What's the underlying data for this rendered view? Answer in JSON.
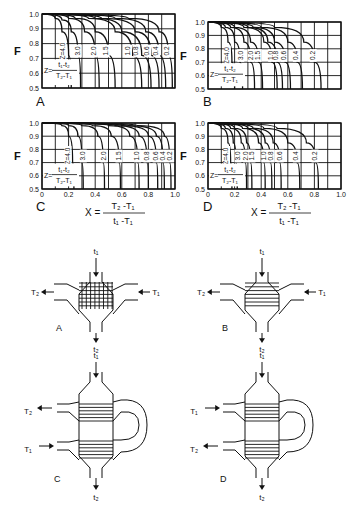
{
  "figure": {
    "y_axis_label": "F",
    "y_ticks": [
      "1.0",
      "0.9",
      "0.8",
      "0.7",
      "0.6",
      "0.5"
    ],
    "x_ticks": [
      "0",
      "0.2",
      "0.4",
      "0.6",
      "0.8",
      "1.0"
    ],
    "z_def": {
      "prefix": "Z=",
      "num": "t₁-t₂",
      "den": "T₂-T₁"
    },
    "x_def": {
      "prefix": "X =",
      "num": "T₂ -T₁",
      "den": "t₁ -T₁"
    },
    "panels": [
      {
        "id": "A",
        "label": "A",
        "z_labels": [
          "Z=4.0",
          "3.0",
          "2.0",
          "1.5",
          "1.0",
          "0.8",
          "0.6",
          "0.4",
          "0.2"
        ]
      },
      {
        "id": "B",
        "label": "B",
        "z_labels": [
          "Z=4.0",
          "3.0",
          "2.0",
          "1.5",
          "1.0",
          "0.8",
          "0.6",
          "0.4",
          "0.2"
        ]
      },
      {
        "id": "C",
        "label": "C",
        "z_labels": [
          "Z=4.0",
          "3.0",
          "2.0",
          "1.5",
          "1.0",
          "0.8",
          "0.6",
          "0.4",
          "0.2"
        ]
      },
      {
        "id": "D",
        "label": "D",
        "z_labels": [
          "Z=4.0",
          "3.0",
          "2.0",
          "1.5",
          "1.0",
          "0.8",
          "0.6",
          "0.4",
          "0.2"
        ]
      }
    ],
    "exchangers": [
      {
        "id": "A",
        "label": "A",
        "top": "t₁",
        "bottom": "t₂",
        "left": "T₂",
        "right": "T₁",
        "type": "crossflow-mixed-grid"
      },
      {
        "id": "B",
        "label": "B",
        "top": "t₁",
        "bottom": "t₂",
        "left": "T₂",
        "right": "T₁",
        "type": "crossflow-single-pass"
      },
      {
        "id": "C",
        "label": "C",
        "top": "t₁",
        "bottom": "t₂",
        "upper_left": "T₂",
        "lower_left": "T₁",
        "type": "two-pass-counter"
      },
      {
        "id": "D",
        "label": "D",
        "top": "t₁",
        "bottom": "t₂",
        "upper_left": "T₁",
        "lower_left": "T₂",
        "type": "two-pass-parallel"
      }
    ]
  },
  "chart_data": [
    {
      "type": "line",
      "title": "A",
      "xlabel": "X = (T2-T1)/(t1-T1)",
      "ylabel": "F",
      "xlim": [
        0,
        1
      ],
      "ylim": [
        0.5,
        1.0
      ],
      "grid": true,
      "series": [
        {
          "name": "Z=4.0",
          "x": [
            0,
            0.1,
            0.15,
            0.2,
            0.22
          ],
          "y": [
            1.0,
            0.97,
            0.88,
            0.72,
            0.5
          ]
        },
        {
          "name": "Z=3.0",
          "x": [
            0,
            0.15,
            0.22,
            0.27,
            0.29
          ],
          "y": [
            1.0,
            0.96,
            0.88,
            0.72,
            0.5
          ]
        },
        {
          "name": "Z=2.0",
          "x": [
            0,
            0.2,
            0.32,
            0.4,
            0.43
          ],
          "y": [
            1.0,
            0.97,
            0.88,
            0.72,
            0.5
          ]
        },
        {
          "name": "Z=1.5",
          "x": [
            0,
            0.25,
            0.4,
            0.5,
            0.55
          ],
          "y": [
            1.0,
            0.97,
            0.88,
            0.72,
            0.5
          ]
        },
        {
          "name": "Z=1.0",
          "x": [
            0,
            0.35,
            0.55,
            0.68,
            0.75
          ],
          "y": [
            1.0,
            0.97,
            0.88,
            0.72,
            0.5
          ]
        },
        {
          "name": "Z=0.8",
          "x": [
            0,
            0.4,
            0.6,
            0.75,
            0.82
          ],
          "y": [
            1.0,
            0.97,
            0.88,
            0.72,
            0.5
          ]
        },
        {
          "name": "Z=0.6",
          "x": [
            0,
            0.45,
            0.7,
            0.82,
            0.88
          ],
          "y": [
            1.0,
            0.97,
            0.88,
            0.72,
            0.5
          ]
        },
        {
          "name": "Z=0.4",
          "x": [
            0,
            0.55,
            0.78,
            0.88,
            0.93
          ],
          "y": [
            1.0,
            0.97,
            0.88,
            0.72,
            0.5
          ]
        },
        {
          "name": "Z=0.2",
          "x": [
            0,
            0.65,
            0.88,
            0.95,
            0.98
          ],
          "y": [
            1.0,
            0.97,
            0.88,
            0.72,
            0.5
          ]
        }
      ]
    },
    {
      "type": "line",
      "title": "B",
      "xlabel": "X = (T2-T1)/(t1-T1)",
      "ylabel": "F",
      "xlim": [
        0,
        1
      ],
      "ylim": [
        0.5,
        1.0
      ],
      "grid": true,
      "series": [
        {
          "name": "Z=4.0",
          "x": [
            0,
            0.1,
            0.15,
            0.18,
            0.2
          ],
          "y": [
            1.0,
            0.96,
            0.85,
            0.7,
            0.5
          ]
        },
        {
          "name": "Z=3.0",
          "x": [
            0,
            0.13,
            0.2,
            0.24,
            0.26
          ],
          "y": [
            1.0,
            0.96,
            0.85,
            0.7,
            0.5
          ]
        },
        {
          "name": "Z=2.0",
          "x": [
            0,
            0.17,
            0.27,
            0.32,
            0.35
          ],
          "y": [
            1.0,
            0.96,
            0.85,
            0.7,
            0.5
          ]
        },
        {
          "name": "Z=1.5",
          "x": [
            0,
            0.2,
            0.32,
            0.38,
            0.41
          ],
          "y": [
            1.0,
            0.96,
            0.85,
            0.7,
            0.5
          ]
        },
        {
          "name": "Z=1.0",
          "x": [
            0,
            0.27,
            0.42,
            0.48,
            0.52
          ],
          "y": [
            1.0,
            0.96,
            0.85,
            0.7,
            0.5
          ]
        },
        {
          "name": "Z=0.8",
          "x": [
            0,
            0.3,
            0.45,
            0.52,
            0.56
          ],
          "y": [
            1.0,
            0.96,
            0.85,
            0.7,
            0.5
          ]
        },
        {
          "name": "Z=0.6",
          "x": [
            0,
            0.34,
            0.5,
            0.58,
            0.62
          ],
          "y": [
            1.0,
            0.96,
            0.85,
            0.7,
            0.5
          ]
        },
        {
          "name": "Z=0.4",
          "x": [
            0,
            0.4,
            0.6,
            0.67,
            0.71
          ],
          "y": [
            1.0,
            0.96,
            0.85,
            0.7,
            0.5
          ]
        },
        {
          "name": "Z=0.2",
          "x": [
            0,
            0.5,
            0.72,
            0.8,
            0.85
          ],
          "y": [
            1.0,
            0.96,
            0.85,
            0.7,
            0.5
          ]
        }
      ]
    },
    {
      "type": "line",
      "title": "C",
      "xlabel": "X = (T2-T1)/(t1-T1)",
      "ylabel": "F",
      "xlim": [
        0,
        1
      ],
      "ylim": [
        0.5,
        1.0
      ],
      "grid": true,
      "series": [
        {
          "name": "Z=4.0",
          "x": [
            0,
            0.15,
            0.2,
            0.23,
            0.24
          ],
          "y": [
            1.0,
            0.98,
            0.9,
            0.7,
            0.5
          ]
        },
        {
          "name": "Z=3.0",
          "x": [
            0,
            0.2,
            0.27,
            0.3,
            0.31
          ],
          "y": [
            1.0,
            0.98,
            0.9,
            0.7,
            0.5
          ]
        },
        {
          "name": "Z=2.0",
          "x": [
            0,
            0.3,
            0.42,
            0.46,
            0.47
          ],
          "y": [
            1.0,
            0.98,
            0.9,
            0.7,
            0.5
          ]
        },
        {
          "name": "Z=1.5",
          "x": [
            0,
            0.38,
            0.52,
            0.58,
            0.59
          ],
          "y": [
            1.0,
            0.98,
            0.9,
            0.7,
            0.5
          ]
        },
        {
          "name": "Z=1.0",
          "x": [
            0,
            0.5,
            0.66,
            0.72,
            0.73
          ],
          "y": [
            1.0,
            0.98,
            0.9,
            0.7,
            0.5
          ]
        },
        {
          "name": "Z=0.8",
          "x": [
            0,
            0.55,
            0.73,
            0.79,
            0.8
          ],
          "y": [
            1.0,
            0.98,
            0.9,
            0.7,
            0.5
          ]
        },
        {
          "name": "Z=0.6",
          "x": [
            0,
            0.6,
            0.8,
            0.86,
            0.87
          ],
          "y": [
            1.0,
            0.98,
            0.9,
            0.7,
            0.5
          ]
        },
        {
          "name": "Z=0.4",
          "x": [
            0,
            0.65,
            0.86,
            0.91,
            0.92
          ],
          "y": [
            1.0,
            0.98,
            0.9,
            0.7,
            0.5
          ]
        },
        {
          "name": "Z=0.2",
          "x": [
            0,
            0.72,
            0.92,
            0.96,
            0.97
          ],
          "y": [
            1.0,
            0.98,
            0.9,
            0.7,
            0.5
          ]
        }
      ]
    },
    {
      "type": "line",
      "title": "D",
      "xlabel": "X = (T2-T1)/(t1-T1)",
      "ylabel": "F",
      "xlim": [
        0,
        1
      ],
      "ylim": [
        0.5,
        1.0
      ],
      "grid": true,
      "series": [
        {
          "name": "Z=4.0",
          "x": [
            0,
            0.1,
            0.15,
            0.17,
            0.18
          ],
          "y": [
            1.0,
            0.96,
            0.85,
            0.7,
            0.5
          ]
        },
        {
          "name": "Z=3.0",
          "x": [
            0,
            0.13,
            0.19,
            0.21,
            0.22
          ],
          "y": [
            1.0,
            0.96,
            0.85,
            0.7,
            0.5
          ]
        },
        {
          "name": "Z=2.0",
          "x": [
            0,
            0.17,
            0.25,
            0.28,
            0.29
          ],
          "y": [
            1.0,
            0.96,
            0.85,
            0.7,
            0.5
          ]
        },
        {
          "name": "Z=1.5",
          "x": [
            0,
            0.2,
            0.29,
            0.32,
            0.33
          ],
          "y": [
            1.0,
            0.96,
            0.85,
            0.7,
            0.5
          ]
        },
        {
          "name": "Z=1.0",
          "x": [
            0,
            0.26,
            0.38,
            0.42,
            0.43
          ],
          "y": [
            1.0,
            0.96,
            0.85,
            0.7,
            0.5
          ]
        },
        {
          "name": "Z=0.8",
          "x": [
            0,
            0.3,
            0.43,
            0.47,
            0.48
          ],
          "y": [
            1.0,
            0.96,
            0.85,
            0.7,
            0.5
          ]
        },
        {
          "name": "Z=0.6",
          "x": [
            0,
            0.34,
            0.49,
            0.54,
            0.55
          ],
          "y": [
            1.0,
            0.96,
            0.85,
            0.7,
            0.5
          ]
        },
        {
          "name": "Z=0.4",
          "x": [
            0,
            0.42,
            0.6,
            0.67,
            0.69
          ],
          "y": [
            1.0,
            0.96,
            0.85,
            0.7,
            0.5
          ]
        },
        {
          "name": "Z=0.2",
          "x": [
            0,
            0.52,
            0.74,
            0.81,
            0.83
          ],
          "y": [
            1.0,
            0.96,
            0.85,
            0.7,
            0.5
          ]
        }
      ]
    }
  ]
}
